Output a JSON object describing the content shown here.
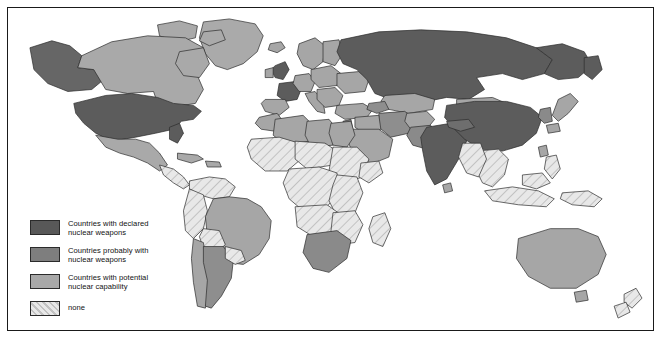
{
  "map": {
    "title": "World map of nuclear weapons status",
    "projection": "world-outline",
    "frame_color": "#1a1a1a",
    "background_color": "#ffffff",
    "border_color": "#2a2a2a"
  },
  "legend": {
    "items": [
      {
        "id": "declared",
        "label": "Countries with declared\nnuclear weapons",
        "color": "#585858",
        "pattern": "solid"
      },
      {
        "id": "probable",
        "label": "Countries probably with\nnuclear weapons",
        "color": "#7e7e7e",
        "pattern": "solid"
      },
      {
        "id": "potential",
        "label": "Countries with potential\nnuclear capability",
        "color": "#a8a8a8",
        "pattern": "solid"
      },
      {
        "id": "none",
        "label": "none",
        "color": "#e3e3e3",
        "pattern": "hatch"
      }
    ]
  },
  "regions": {
    "declared": [
      "United States",
      "Russia",
      "China",
      "India",
      "United Kingdom",
      "France"
    ],
    "probable": [
      "Pakistan",
      "Israel",
      "South Africa",
      "North Korea"
    ],
    "potential": [
      "Canada",
      "Brazil",
      "Argentina",
      "Australia",
      "Japan",
      "Germany",
      "Italy",
      "Spain",
      "Sweden",
      "Norway",
      "Finland",
      "Poland",
      "Ukraine",
      "Kazakhstan",
      "Iran",
      "Iraq",
      "Turkey",
      "Egypt",
      "Libya",
      "Algeria",
      "South Korea",
      "Taiwan",
      "Mexico",
      "Mongolia",
      "Saudi Arabia"
    ],
    "none": [
      "Central Africa",
      "West Africa",
      "East Africa",
      "Southeast Asia",
      "New Zealand",
      "Greenland",
      "Central America",
      "Northern South America"
    ]
  }
}
